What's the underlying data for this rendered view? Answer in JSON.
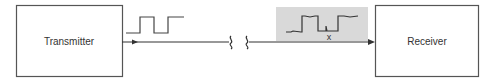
{
  "transmitter": {
    "label": "Transmitter"
  },
  "receiver": {
    "label": "Receiver"
  },
  "noise_marker": {
    "label": "x"
  },
  "colors": {
    "line": "#333333",
    "noisy_panel": "#d9d9d9",
    "box_border": "#555555"
  }
}
